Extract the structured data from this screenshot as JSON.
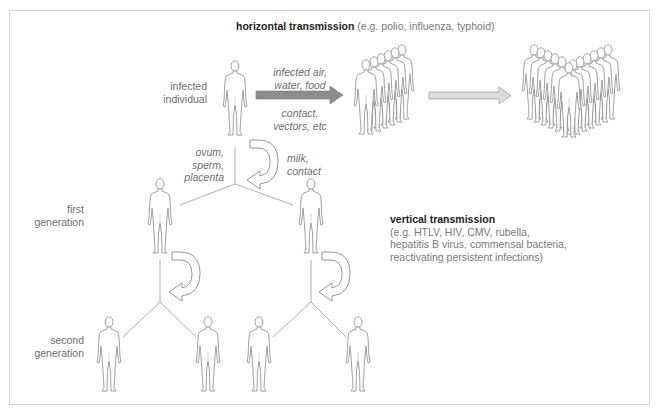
{
  "diagram": {
    "horizontal": {
      "title": "horizontal transmission",
      "examples": "(e.g. polio, influenza, typhoid)",
      "route_upper": [
        "infected air,",
        "water, food"
      ],
      "route_lower": [
        "contact,",
        "vectors, etc"
      ]
    },
    "vertical": {
      "title": "vertical transmission",
      "examples": [
        "(e.g. HTLV, HIV, CMV, rubella,",
        "hepatitis B virus, commensal bacteria,",
        "reactivating persistent infections)"
      ],
      "route_left": [
        "ovum,",
        "sperm,",
        "placenta"
      ],
      "route_right": [
        "milk,",
        "contact"
      ]
    },
    "labels": {
      "infected_individual": [
        "infected",
        "individual"
      ],
      "first_generation": [
        "first",
        "generation"
      ],
      "second_generation": [
        "second",
        "generation"
      ]
    },
    "colors": {
      "figure_stroke": "#8a8a8a",
      "arrow_dark": "#8c8c8c",
      "arrow_light": "#d6d6d6",
      "frame": "#d4d4d4",
      "line": "#9a9a9a"
    }
  }
}
